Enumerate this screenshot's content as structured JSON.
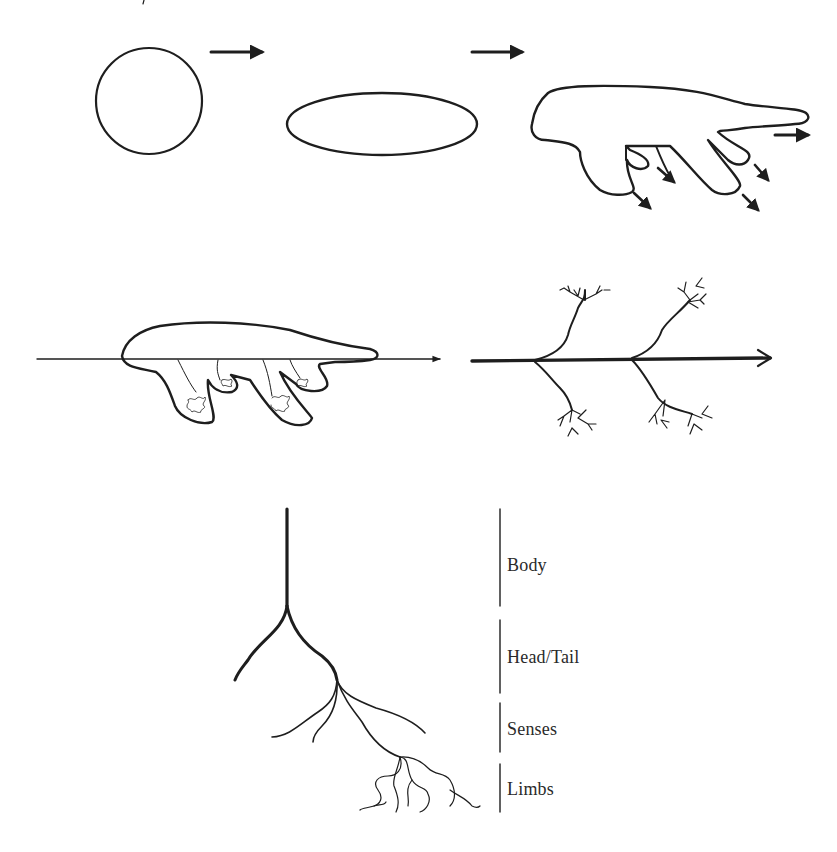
{
  "figure": {
    "stroke_color": "#1e1e1e",
    "background": "#ffffff",
    "top_row": {
      "stages": [
        {
          "id": "sphere",
          "shape": "circle"
        },
        {
          "id": "elongated",
          "shape": "ellipse"
        },
        {
          "id": "budding",
          "shape": "body-with-limb-buds"
        }
      ],
      "arrows": [
        "arrow-sphere-to-ellipse",
        "arrow-ellipse-to-budding"
      ]
    },
    "middle_row": {
      "stages": [
        {
          "id": "organism-on-axis",
          "shape": "body-on-horizontal-axis"
        },
        {
          "id": "branching-axis",
          "shape": "axis-with-dendritic-branches"
        }
      ]
    },
    "bottom_row": {
      "tree": {
        "id": "body-plan-tree"
      },
      "segments": [
        {
          "label": "Body"
        },
        {
          "label": "Head/Tail"
        },
        {
          "label": "Senses"
        },
        {
          "label": "Limbs"
        }
      ]
    }
  }
}
